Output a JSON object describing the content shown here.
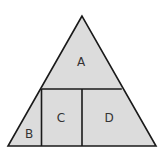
{
  "diagram": {
    "type": "partitioned-triangle",
    "colors": {
      "fill": "#dcdcdc",
      "stroke": "#1a1a1a",
      "text": "#333333"
    },
    "regions": [
      {
        "id": "A",
        "label": "A"
      },
      {
        "id": "B",
        "label": "B"
      },
      {
        "id": "C",
        "label": "C"
      },
      {
        "id": "D",
        "label": "D"
      }
    ]
  }
}
